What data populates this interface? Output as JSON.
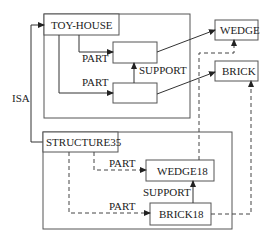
{
  "diagram": {
    "type": "semantic-network",
    "nodes": {
      "toy_house": "TOY-HOUSE",
      "structure35": "STRUCTURE35",
      "wedge": "WEDGE",
      "brick": "BRICK",
      "wedge18": "WEDGE18",
      "brick18": "BRICK18"
    },
    "edge_labels": {
      "isa": "ISA",
      "part_top_upper": "PART",
      "part_top_lower": "PART",
      "support_top": "SUPPORT",
      "part_bottom_upper": "PART",
      "part_bottom_lower": "PART",
      "support_bottom": "SUPPORT"
    },
    "edges": [
      {
        "from": "STRUCTURE35",
        "to": "TOY-HOUSE",
        "label": "ISA",
        "style": "solid"
      },
      {
        "from": "TOY-HOUSE",
        "to": "upper-slot",
        "label": "PART",
        "style": "solid"
      },
      {
        "from": "TOY-HOUSE",
        "to": "lower-slot",
        "label": "PART",
        "style": "solid"
      },
      {
        "from": "lower-slot",
        "to": "upper-slot",
        "label": "SUPPORT",
        "style": "solid"
      },
      {
        "from": "upper-slot",
        "to": "WEDGE",
        "label": "",
        "style": "solid"
      },
      {
        "from": "lower-slot",
        "to": "BRICK",
        "label": "",
        "style": "solid"
      },
      {
        "from": "STRUCTURE35",
        "to": "WEDGE18",
        "label": "PART",
        "style": "dashed"
      },
      {
        "from": "STRUCTURE35",
        "to": "BRICK18",
        "label": "PART",
        "style": "dashed"
      },
      {
        "from": "BRICK18",
        "to": "WEDGE18",
        "label": "SUPPORT",
        "style": "solid"
      },
      {
        "from": "WEDGE18",
        "to": "WEDGE",
        "label": "",
        "style": "dashed"
      },
      {
        "from": "BRICK18",
        "to": "BRICK",
        "label": "",
        "style": "dashed"
      }
    ]
  }
}
